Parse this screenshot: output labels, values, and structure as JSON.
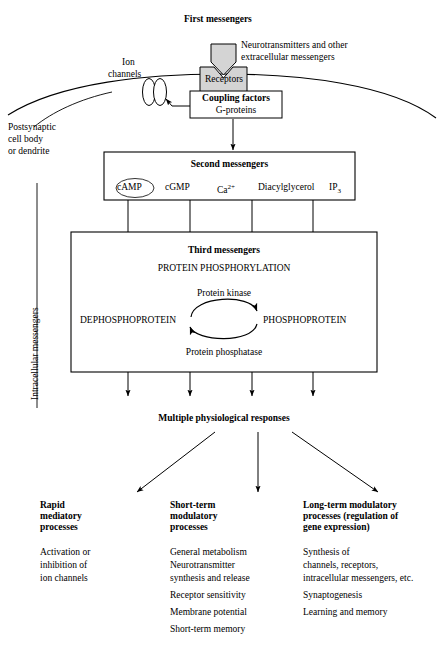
{
  "diagram": {
    "title_first_messengers": "First messengers",
    "ligand_caption_line1": "Neurotransmitters and other",
    "ligand_caption_line2": "extracellular messengers",
    "ion_channels_line1": "Ion",
    "ion_channels_line2": "channels",
    "receptors_label": "Receptors",
    "coupling_factors_title": "Coupling factors",
    "coupling_factors_sub": "G-proteins",
    "postsynaptic_line1": "Postsynaptic",
    "postsynaptic_line2": "cell body",
    "postsynaptic_line3": "or dendrite",
    "intracellular_messengers": "Intracellular messengers"
  },
  "second_messengers": {
    "title": "Second messengers",
    "items": [
      {
        "label": "cAMP",
        "highlighted": "true"
      },
      {
        "label": "cGMP",
        "highlighted": "false"
      },
      {
        "label": "Ca",
        "superscript": "2+",
        "highlighted": "false"
      },
      {
        "label": "Diacylglycerol",
        "highlighted": "false"
      },
      {
        "label": "IP",
        "subscript": "3",
        "highlighted": "false"
      }
    ]
  },
  "third_messengers": {
    "title": "Third messengers",
    "subtitle": "PROTEIN PHOSPHORYLATION",
    "kinase_label": "Protein kinase",
    "phosphatase_label": "Protein phosphatase",
    "left_state": "DEPHOSPHOPROTEIN",
    "right_state": "PHOSPHOPROTEIN"
  },
  "responses": {
    "title": "Multiple physiological responses",
    "columns": [
      {
        "heading_line1": "Rapid",
        "heading_line2": "mediatory",
        "heading_line3": "processes",
        "items": [
          "Activation or",
          "inhibition of",
          "ion channels"
        ]
      },
      {
        "heading_line1": "Short-term",
        "heading_line2": "modulatory",
        "heading_line3": "processes",
        "items": [
          "General metabolism",
          "Neurotransmitter",
          "synthesis and release",
          "Receptor sensitivity",
          "Membrane potential",
          "Short-term memory"
        ]
      },
      {
        "heading_line1": "Long-term modulatory",
        "heading_line2": "processes (regulation of",
        "heading_line3": "gene expression)",
        "items": [
          "Synthesis of",
          "channels, receptors,",
          "intracellular messengers, etc.",
          "Synaptogenesis",
          "Learning and memory"
        ]
      }
    ]
  },
  "colors": {
    "line": "#000000",
    "receptor_fill": "#d4d4d4",
    "background": "#ffffff"
  }
}
